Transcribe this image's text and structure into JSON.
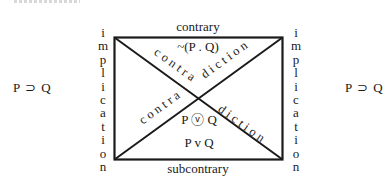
{
  "diagram": {
    "left_formula": "P ⊃ Q",
    "right_formula": "P ⊃ Q",
    "left_vertical_label": [
      "i",
      "m",
      "p",
      "l",
      "i",
      "c",
      "a",
      "t",
      "i",
      "o",
      "n"
    ],
    "right_vertical_label": [
      "i",
      "m",
      "p",
      "l",
      "i",
      "c",
      "a",
      "t",
      "i",
      "o",
      "n"
    ],
    "top_edge_label": "contrary",
    "bottom_edge_label": "subcontrary",
    "top_inner_formula": "~(P . Q)",
    "middle_inner_formula": "P ⓥ Q",
    "bottom_inner_formula": "P v Q",
    "diagonal_labels": {
      "upper_left_part": "contra",
      "upper_right_part": "diction",
      "lower_left_part": "contra",
      "lower_right_part": "diction"
    },
    "colors": {
      "line": "#1a1a1a",
      "background": "#ffffff"
    }
  }
}
